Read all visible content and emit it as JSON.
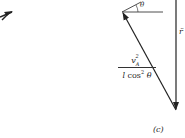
{
  "diagram": {
    "panel_label": "(c)",
    "angle_label": "θ",
    "vertical_vector_label": "r̈",
    "diagonal_vector_label": {
      "numerator_base": "v",
      "numerator_sub": "A",
      "numerator_sup": "2",
      "denominator_l": "l",
      "denominator_cos": "cos",
      "denominator_sup": "2",
      "denominator_theta": "θ"
    }
  }
}
